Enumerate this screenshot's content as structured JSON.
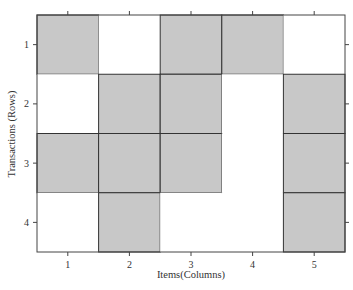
{
  "chart_data": {
    "type": "heatmap",
    "title": "",
    "xlabel": "Items(Columns)",
    "ylabel": "Transactions (Rows)",
    "x_ticks": [
      "1",
      "2",
      "3",
      "4",
      "5"
    ],
    "y_ticks": [
      "1",
      "2",
      "3",
      "4"
    ],
    "grid": false,
    "legend": null,
    "filled_color": "#c8c8c8",
    "empty_color": "#ffffff",
    "matrix": [
      [
        1,
        0,
        1,
        1,
        0
      ],
      [
        0,
        1,
        1,
        0,
        1
      ],
      [
        1,
        1,
        1,
        0,
        1
      ],
      [
        0,
        1,
        0,
        0,
        1
      ]
    ]
  }
}
